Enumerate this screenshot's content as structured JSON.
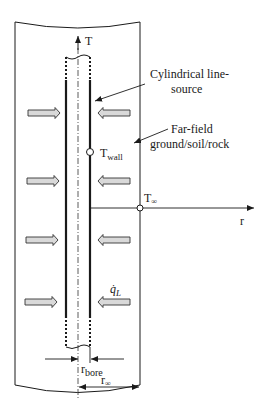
{
  "diagram": {
    "type": "borehole cylindrical line-source heat transfer schematic",
    "labels": {
      "axis_vertical": "T",
      "axis_radial": "r",
      "line_source": "Cylindrical line-",
      "line_source_2": "source",
      "far_field": "Far-field",
      "far_field_2": "ground/soil/rock",
      "t_wall_main": "T",
      "t_wall_sub": "wall",
      "t_inf_main": "T",
      "t_inf_sub": "∞",
      "heat_flux_main": "q̇",
      "heat_flux_sub": "L",
      "r_bore_main": "r",
      "r_bore_sub": "bore",
      "r_inf_main": "r",
      "r_inf_sub": "∞"
    },
    "heat_arrows": {
      "count_per_side": 4,
      "left_direction": "inward (right)",
      "right_direction": "inward (left)",
      "fill_color": "#d9d9d9",
      "stroke_color": "#333333"
    },
    "colors": {
      "line": "#1a1a1a",
      "background": "#ffffff"
    }
  }
}
